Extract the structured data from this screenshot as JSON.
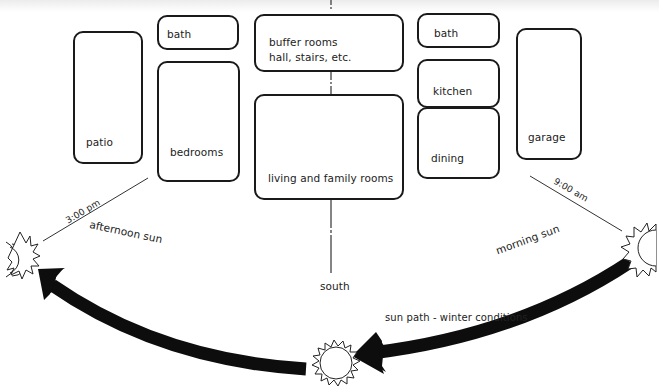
{
  "diagram": {
    "rooms": {
      "patio": "patio",
      "bath_left": "bath",
      "bedrooms": "bedrooms",
      "buffer_line1": "buffer rooms",
      "buffer_line2": "hall, stairs, etc.",
      "living": "living and family rooms",
      "bath_right": "bath",
      "kitchen": "kitchen",
      "dining": "dining",
      "garage": "garage"
    },
    "annotations": {
      "afternoon_time": "3:00 pm",
      "afternoon_label": "afternoon sun",
      "morning_time": "9:00 am",
      "morning_label": "morning sun",
      "south": "south",
      "sun_path": "sun path - winter conditions"
    },
    "colors": {
      "stroke": "#1a1a1a",
      "arrow": "#0d0d0d",
      "background": "#ffffff"
    }
  }
}
